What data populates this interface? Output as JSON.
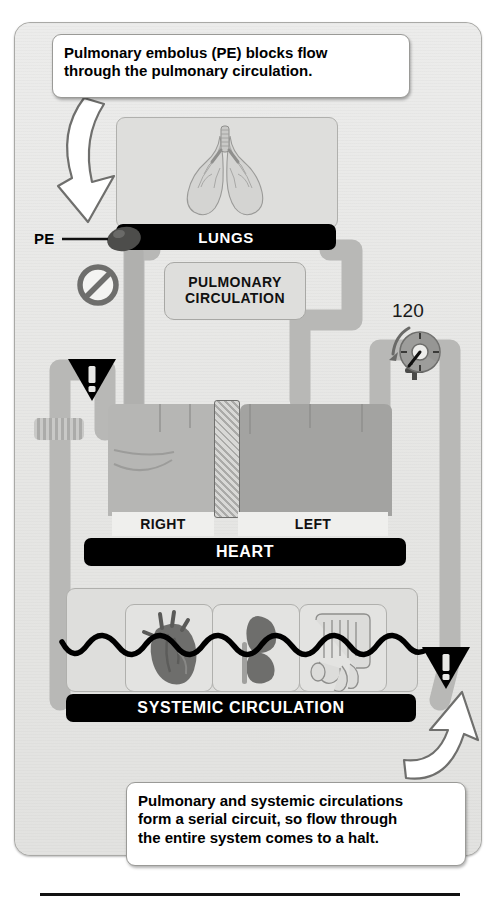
{
  "figure": {
    "background_color": "#ffffff",
    "panel_color": "#e8e8e6"
  },
  "callouts": [
    {
      "id": "top-callout",
      "lines": [
        "Pulmonary embolus (PE) blocks flow",
        "through the pulmonary circulation."
      ],
      "text": "Pulmonary embolus (PE) blocks flow through the pulmonary circulation.",
      "pointer": "arrow-down-left-to-pe"
    },
    {
      "id": "bottom-callout",
      "lines": [
        "Pulmonary and systemic circulations",
        "form a serial circuit, so flow through",
        "the entire system comes to a halt."
      ],
      "text": "Pulmonary and systemic circulations form a serial circuit, so flow through the entire system comes to a halt.",
      "pointer": "arrow-up-right-to-systemic"
    }
  ],
  "labels": {
    "lungs": "LUNGS",
    "pulmonary_circulation_line1": "PULMONARY",
    "pulmonary_circulation_line2": "CIRCULATION",
    "heart": "HEART",
    "heart_right": "RIGHT",
    "heart_left": "LEFT",
    "systemic_circulation": "SYSTEMIC CIRCULATION",
    "pe": "PE"
  },
  "gauge": {
    "name": "pressure-gauge",
    "value": "120",
    "unit_implied": "mmHg",
    "needle_direction": "down-left",
    "trend_arrow": "counterclockwise-falling"
  },
  "icons": [
    {
      "name": "no-entry-icon",
      "meaning": "flow blocked in pulmonary artery"
    },
    {
      "name": "warning-triangle-icon-left",
      "meaning": "no venous return / flow halt"
    },
    {
      "name": "warning-triangle-icon-right",
      "meaning": "systemic flow halt"
    },
    {
      "name": "embolus-icon",
      "meaning": "pulmonary embolus occluding vessel"
    }
  ],
  "organ_panels": [
    {
      "name": "heart-organ-icon",
      "label": ""
    },
    {
      "name": "kidney-organ-icon",
      "label": ""
    },
    {
      "name": "intestines-organ-icon",
      "label": ""
    }
  ],
  "colors": {
    "vessel": "#b9b9b7",
    "bar": "#000000",
    "panel": "#e8e8e6",
    "callout": "#ffffff",
    "embolus": "#4a4a48"
  }
}
